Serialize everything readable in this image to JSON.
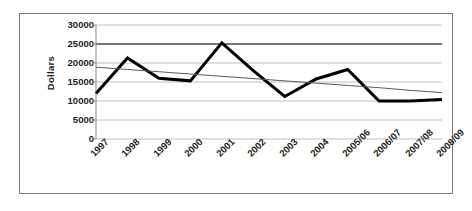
{
  "chart_data": {
    "type": "line",
    "title": "",
    "xlabel": "",
    "ylabel": "Dollars",
    "categories": [
      "1997",
      "1998",
      "1999",
      "2000",
      "2001",
      "2002",
      "2003",
      "2004",
      "2005/06",
      "2006/07",
      "2007/08",
      "2008/09"
    ],
    "series": [
      {
        "name": "Dollars",
        "values": [
          12000,
          21300,
          16000,
          15300,
          25300,
          18000,
          11200,
          15800,
          18300,
          10000,
          10000,
          10400
        ],
        "color": "#000000",
        "line_width": 3
      },
      {
        "name": "Linear trendline",
        "values": [
          18900,
          18300,
          17700,
          17100,
          16500,
          15900,
          15300,
          14700,
          14100,
          13500,
          12800,
          12200
        ],
        "color": "#5a5a5a",
        "line_width": 1
      }
    ],
    "ylim": [
      0,
      30000
    ],
    "ytick_labels": [
      "30000",
      "25000",
      "20000",
      "15000",
      "10000",
      "5000",
      "0"
    ],
    "ytick_values": [
      30000,
      25000,
      20000,
      15000,
      10000,
      5000,
      0
    ],
    "grid": true,
    "grid_color": "#b7b7b7",
    "emphasis_gridline": 25000,
    "legend": "none",
    "border_color": "#7a7a7a"
  }
}
